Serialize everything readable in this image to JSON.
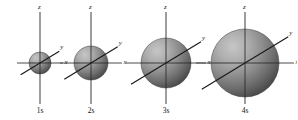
{
  "figure": {
    "background_color": "#ffffff",
    "width": 297,
    "height": 120,
    "axis_color": "#4d4d4d",
    "diagonal_axis_color": "#1a1a1a",
    "sphere_light_color": "#b9b9b9",
    "sphere_mid_color": "#8c8c8c",
    "sphere_dark_color": "#4a4a4a",
    "sphere_edge_color": "#3a3a3a"
  },
  "orbitals": [
    {
      "name": "1s",
      "label_z": "z",
      "label_x": "x",
      "label_y": "y",
      "center_x": 40,
      "center_y": 63,
      "radius": 11,
      "axis_half_len_x": 23,
      "axis_top_y": 12,
      "axis_bottom_y": 104,
      "diag_len": 21
    },
    {
      "name": "2s",
      "label_z": "z",
      "label_x": "x",
      "label_y": "y",
      "center_x": 91,
      "center_y": 63,
      "radius": 17,
      "axis_half_len_x": 31,
      "axis_top_y": 12,
      "axis_bottom_y": 104,
      "diag_len": 29
    },
    {
      "name": "3s",
      "label_z": "z",
      "label_x": "x",
      "label_y": "y",
      "center_x": 166,
      "center_y": 63,
      "radius": 25,
      "axis_half_len_x": 40,
      "axis_top_y": 12,
      "axis_bottom_y": 104,
      "diag_len": 38
    },
    {
      "name": "4s",
      "label_z": "z",
      "label_x": "x",
      "label_y": "y",
      "center_x": 245,
      "center_y": 63,
      "radius": 34,
      "axis_half_len_x": 49,
      "axis_top_y": 12,
      "axis_bottom_y": 104,
      "diag_len": 47
    }
  ]
}
